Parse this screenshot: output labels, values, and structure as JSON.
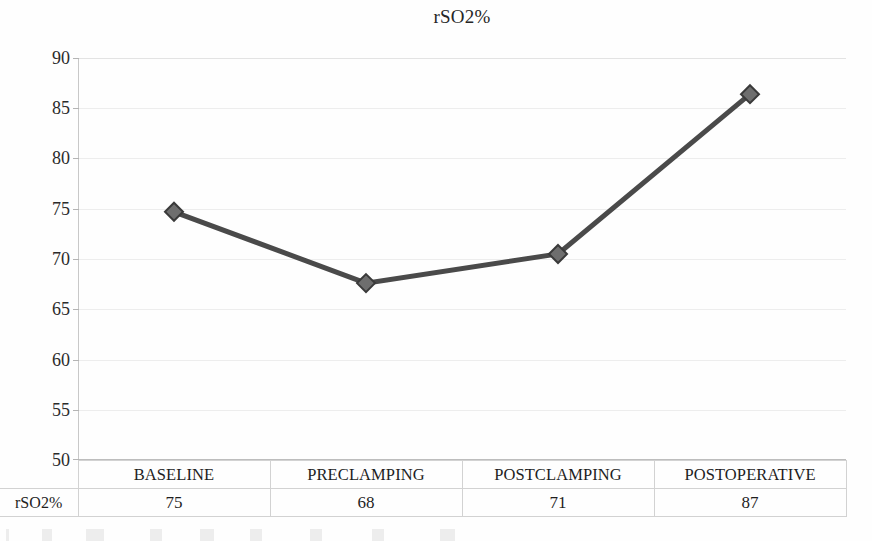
{
  "chart_data": {
    "type": "line",
    "title": "rSO2%",
    "xlabel": "",
    "ylabel": "",
    "ylim": [
      50,
      90
    ],
    "ytick_step": 5,
    "yticks": [
      90,
      85,
      80,
      75,
      70,
      65,
      60,
      55,
      50
    ],
    "grid": true,
    "legend": "none",
    "series_name": "rSO2%",
    "series_color": "#4a4a4a",
    "marker": "diamond",
    "marker_color": "#6b6b6b",
    "categories": [
      "BASELINE",
      "PRECLAMPING",
      "POSTCLAMPING",
      "POSTOPERATIVE"
    ],
    "values": [
      75,
      68,
      71,
      87
    ],
    "plotted_values": [
      74.7,
      67.6,
      70.5,
      86.4
    ],
    "series": [
      {
        "name": "rSO2%",
        "values": [
          75,
          68,
          71,
          87
        ]
      }
    ]
  },
  "title": {
    "text": "rSO2%"
  },
  "axis": {
    "y_ticks": [
      "90",
      "85",
      "80",
      "75",
      "70",
      "65",
      "60",
      "55",
      "50"
    ]
  },
  "table": {
    "row_label": "rSO2%",
    "categories": [
      "BASELINE",
      "PRECLAMPING",
      "POSTCLAMPING",
      "POSTOPERATIVE"
    ],
    "values": [
      "75",
      "68",
      "71",
      "87"
    ]
  },
  "colors": {
    "line": "#4a4a4a",
    "marker_fill": "#6e6e6e",
    "marker_stroke": "#3a3a3a",
    "gridline": "#ededed",
    "axis": "#c8c8c8",
    "text": "#1e1e1e",
    "table_border": "#d2d2d2"
  }
}
